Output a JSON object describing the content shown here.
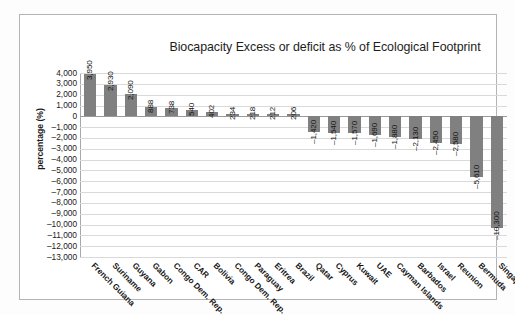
{
  "chart_data": {
    "type": "bar",
    "title": "Biocapacity Excess or deficit as % of Ecological Footprint",
    "xlabel": "",
    "ylabel": "percentage (%)",
    "ylim": [
      -13000,
      4000
    ],
    "ytick_step": 1000,
    "grid": true,
    "legend": "none",
    "bar_color": "#808080",
    "categories": [
      "French Guiana",
      "Suriname",
      "Guyana",
      "Gabon",
      "Congo Dem. Rep.",
      "CAR",
      "Bolivia",
      "Congo Dem. Rep.",
      "Paraguay",
      "Eritrea",
      "Brazil",
      "Qatar",
      "Cyprus",
      "Kuwait",
      "UAE",
      "Cayman Islands",
      "Barbados",
      "Israel",
      "Reunion",
      "Bermuda",
      "Singapore"
    ],
    "values": [
      3950,
      2930,
      2090,
      888,
      738,
      540,
      402,
      234,
      218,
      212,
      206,
      -1420,
      -1540,
      -1570,
      -1690,
      -1880,
      -2130,
      -2450,
      -2580,
      -5610,
      -10300
    ],
    "value_labels": [
      "3,950",
      "2,930",
      "2,090",
      "888",
      "738",
      "540",
      "402",
      "234",
      "218",
      "212",
      "206",
      "–1,420",
      "–1,540",
      "–1,570",
      "–1,690",
      "–1,880",
      "–2,130",
      "–2,450",
      "–2,580",
      "–5,610",
      "–10,300"
    ],
    "ytick_labels": [
      "4,000",
      "3,000",
      "2,000",
      "1,000",
      "0",
      "–1,000",
      "–2,000",
      "–3,000",
      "–4,000",
      "–5,000",
      "–6,000",
      "–7,000",
      "–8,000",
      "–9,000",
      "–10,000",
      "–11,000",
      "–12,000",
      "–13,000"
    ],
    "ytick_values": [
      4000,
      3000,
      2000,
      1000,
      0,
      -1000,
      -2000,
      -3000,
      -4000,
      -5000,
      -6000,
      -7000,
      -8000,
      -9000,
      -10000,
      -11000,
      -12000,
      -13000
    ]
  }
}
